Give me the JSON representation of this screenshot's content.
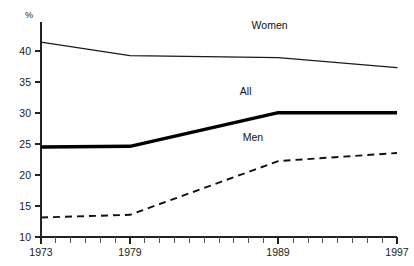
{
  "chart_data": {
    "type": "line",
    "title": "",
    "subtitle": "",
    "xlabel": "",
    "ylabel": "",
    "unit_label": "%",
    "x": [
      1973,
      1979,
      1989,
      1997
    ],
    "categories": [
      "1973",
      "1979",
      "1989",
      "1997"
    ],
    "xlim": [
      1973,
      1997
    ],
    "ylim": [
      10,
      42
    ],
    "ytick_labels": [
      "10",
      "15",
      "20",
      "25",
      "30",
      "35",
      "40"
    ],
    "ytick_values": [
      10,
      15,
      20,
      25,
      30,
      35,
      40
    ],
    "xtick_labels": [
      "1973",
      "1979",
      "1989",
      "1997"
    ],
    "xtick_values": [
      1973,
      1979,
      1989,
      1997
    ],
    "x_minor_ticks": [
      1974,
      1975,
      1976,
      1977,
      1978,
      1980,
      1981,
      1982,
      1983,
      1984,
      1985,
      1986,
      1987,
      1988,
      1990,
      1991,
      1992,
      1993,
      1994,
      1995,
      1996
    ],
    "grid": false,
    "legend_position": "inline-annotations",
    "series": [
      {
        "name": "Women",
        "style": "thin-solid",
        "values": [
          39.0,
          37.0,
          36.7,
          35.2
        ],
        "label_x": 1987.2,
        "label_y": 41.0
      },
      {
        "name": "All",
        "style": "thick-solid",
        "values": [
          23.4,
          23.5,
          28.5,
          28.5
        ],
        "label_x": 1986.4,
        "label_y": 31.2
      },
      {
        "name": "Men",
        "style": "dashed",
        "values": [
          12.9,
          13.3,
          21.3,
          22.5
        ],
        "label_x": 1986.6,
        "label_y": 24.3
      }
    ]
  },
  "annotations": {
    "women_label": "Women",
    "all_label": "All",
    "men_label": "Men"
  },
  "axes": {
    "unit": "%",
    "y_ticks": [
      "10",
      "15",
      "20",
      "25",
      "30",
      "35",
      "40"
    ],
    "x_ticks": [
      "1973",
      "1979",
      "1989",
      "1997"
    ]
  }
}
